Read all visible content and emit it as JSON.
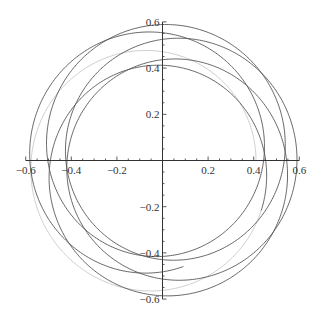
{
  "chart_data": {
    "type": "line",
    "title": "",
    "xlabel": "",
    "ylabel": "",
    "xlim": [
      -0.6,
      0.6
    ],
    "ylim": [
      -0.6,
      0.6
    ],
    "grid": false,
    "legend": "none",
    "x_ticks": [
      {
        "value": -0.6,
        "label": "-0.6"
      },
      {
        "value": -0.4,
        "label": "-0.4"
      },
      {
        "value": -0.2,
        "label": "-0.2"
      },
      {
        "value": 0.2,
        "label": "0.2"
      },
      {
        "value": 0.4,
        "label": "0.4"
      },
      {
        "value": 0.6,
        "label": "0.6"
      }
    ],
    "y_ticks": [
      {
        "value": 0.6,
        "label": "0.6"
      },
      {
        "value": 0.4,
        "label": "0.4"
      },
      {
        "value": 0.2,
        "label": "0.2"
      },
      {
        "value": -0.2,
        "label": "-0.2"
      },
      {
        "value": -0.4,
        "label": "-0.4"
      },
      {
        "value": -0.6,
        "label": "-0.6"
      }
    ],
    "series": [
      {
        "name": "orbit-start",
        "color": "#c8c8c8",
        "description": "first loop, nearly circular, radius about 0.41",
        "param": {
          "R": 0.5,
          "d": 0.09,
          "omega": 0.17,
          "phase": 3.1416,
          "t_start": 0,
          "t_end": 6.0
        }
      },
      {
        "name": "orbit",
        "color": "#555555",
        "description": "precessing rosette orbit, radius varying between about 0.41 and 0.59",
        "param": {
          "R": 0.5,
          "d": 0.09,
          "omega": 0.17,
          "phase": 3.1416,
          "t_start": 6.0,
          "t_end": 36.5
        }
      }
    ]
  }
}
